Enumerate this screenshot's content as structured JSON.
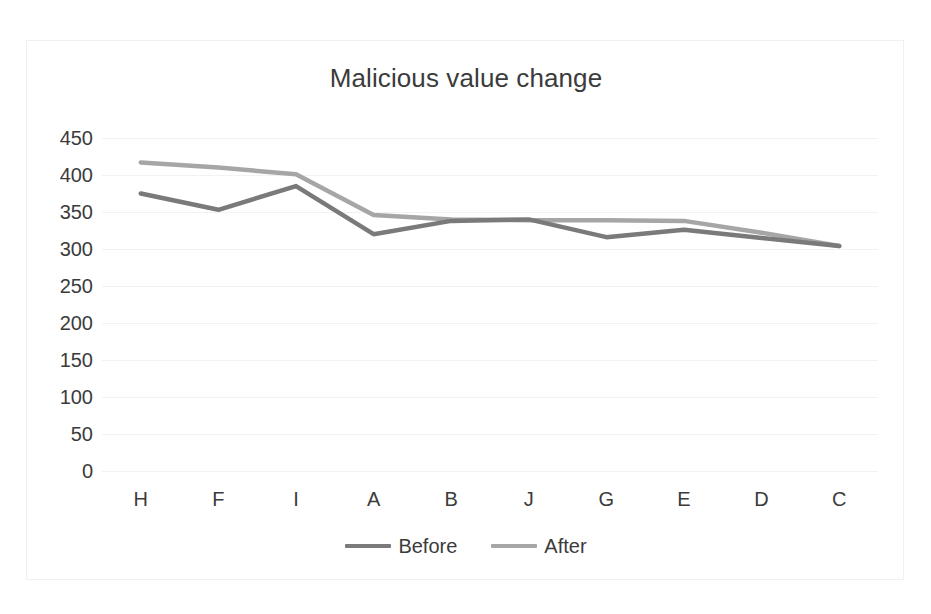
{
  "chart_data": {
    "type": "line",
    "title": "Malicious value change",
    "xlabel": "",
    "ylabel": "",
    "categories": [
      "H",
      "F",
      "I",
      "A",
      "B",
      "J",
      "G",
      "E",
      "D",
      "C"
    ],
    "series": [
      {
        "name": "Before",
        "color": "#7a7a7a",
        "values": [
          375,
          353,
          385,
          320,
          338,
          340,
          316,
          326,
          315,
          304
        ]
      },
      {
        "name": "After",
        "color": "#a6a6a6",
        "values": [
          417,
          410,
          401,
          346,
          340,
          339,
          339,
          338,
          322,
          304
        ]
      }
    ],
    "ylim": [
      0,
      450
    ],
    "yticks": [
      450,
      400,
      350,
      300,
      250,
      200,
      150,
      100,
      50,
      0
    ],
    "ytick_labels": [
      "450",
      "400",
      "350",
      "300",
      "250",
      "200",
      "150",
      "100",
      "50",
      "0"
    ],
    "grid": true,
    "gridline_color": "#f2f2f2",
    "legend_position": "bottom",
    "legend_entries": [
      "Before",
      "After"
    ],
    "background_color": "#ffffff",
    "border_color": "#f0f0f0",
    "text_color": "#3b3b3b"
  }
}
